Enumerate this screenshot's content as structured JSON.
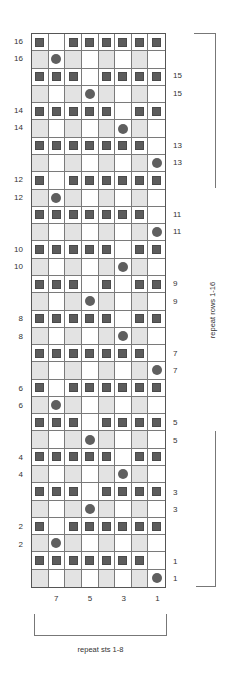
{
  "chart": {
    "columns": 8,
    "legend_symbols": {
      "S": "square-stitch-icon",
      "D": "dot-stitch-icon",
      ".": "empty"
    },
    "colors": {
      "square": "#5c5c5c",
      "dot": "#5f5f5f",
      "shaded_column": "#e3e3e3",
      "grid_line": "#7a7a7a",
      "border": "#555555"
    },
    "rows": [
      {
        "label": "16",
        "side": "left",
        "type": "square",
        "pattern": "S.SSSSSS"
      },
      {
        "label": "16",
        "side": "left",
        "type": "dot",
        "pattern": ".D......"
      },
      {
        "label": "15",
        "side": "right",
        "type": "square",
        "pattern": "SSS.SSSS"
      },
      {
        "label": "15",
        "side": "right",
        "type": "dot",
        "pattern": "...D...."
      },
      {
        "label": "14",
        "side": "left",
        "type": "square",
        "pattern": "SSSSS.SS"
      },
      {
        "label": "14",
        "side": "left",
        "type": "dot",
        "pattern": ".....D.."
      },
      {
        "label": "13",
        "side": "right",
        "type": "square",
        "pattern": "SSSSSSS."
      },
      {
        "label": "13",
        "side": "right",
        "type": "dot",
        "pattern": ".......D"
      },
      {
        "label": "12",
        "side": "left",
        "type": "square",
        "pattern": "S.SSSSSS"
      },
      {
        "label": "12",
        "side": "left",
        "type": "dot",
        "pattern": ".D......"
      },
      {
        "label": "11",
        "side": "right",
        "type": "square",
        "pattern": "SSSSSSS."
      },
      {
        "label": "11",
        "side": "right",
        "type": "dot",
        "pattern": ".......D"
      },
      {
        "label": "10",
        "side": "left",
        "type": "square",
        "pattern": "SSSSS.SS"
      },
      {
        "label": "10",
        "side": "left",
        "type": "dot",
        "pattern": ".....D.."
      },
      {
        "label": "9",
        "side": "right",
        "type": "square",
        "pattern": "SSS.S.SS"
      },
      {
        "label": "9",
        "side": "right",
        "type": "dot",
        "pattern": "...D...."
      },
      {
        "label": "8",
        "side": "left",
        "type": "square",
        "pattern": "SSSSS.SS"
      },
      {
        "label": "8",
        "side": "left",
        "type": "dot",
        "pattern": ".....D.."
      },
      {
        "label": "7",
        "side": "right",
        "type": "square",
        "pattern": "SSSSSSS."
      },
      {
        "label": "7",
        "side": "right",
        "type": "dot",
        "pattern": ".......D"
      },
      {
        "label": "6",
        "side": "left",
        "type": "square",
        "pattern": "S.SSSSSS"
      },
      {
        "label": "6",
        "side": "left",
        "type": "dot",
        "pattern": ".D......"
      },
      {
        "label": "5",
        "side": "right",
        "type": "square",
        "pattern": "SSS.SSSS"
      },
      {
        "label": "5",
        "side": "right",
        "type": "dot",
        "pattern": "...D...."
      },
      {
        "label": "4",
        "side": "left",
        "type": "square",
        "pattern": "SSSSS.SS"
      },
      {
        "label": "4",
        "side": "left",
        "type": "dot",
        "pattern": ".....D.."
      },
      {
        "label": "3",
        "side": "right",
        "type": "square",
        "pattern": "SSS.SSSS"
      },
      {
        "label": "3",
        "side": "right",
        "type": "dot",
        "pattern": "...D...."
      },
      {
        "label": "2",
        "side": "left",
        "type": "square",
        "pattern": "S.SSSSSS"
      },
      {
        "label": "2",
        "side": "left",
        "type": "dot",
        "pattern": ".D......"
      },
      {
        "label": "1",
        "side": "right",
        "type": "square",
        "pattern": "SSSSSSS."
      },
      {
        "label": "1",
        "side": "right",
        "type": "dot",
        "pattern": ".......D"
      }
    ],
    "column_labels": [
      {
        "label": "7",
        "col_index": 1
      },
      {
        "label": "5",
        "col_index": 3
      },
      {
        "label": "3",
        "col_index": 5
      },
      {
        "label": "1",
        "col_index": 7
      }
    ]
  },
  "annotations": {
    "repeat_rows": "repeat rows 1-16",
    "repeat_sts": "repeat sts 1-8"
  }
}
